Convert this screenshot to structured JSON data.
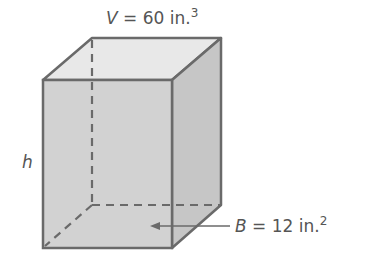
{
  "figure": {
    "type": "rectangular prism",
    "volume_label": {
      "var": "V",
      "eq": " = 60 in.",
      "sup": "3"
    },
    "height_label": "h",
    "base_label": {
      "var": "B",
      "eq": " = 12 in.",
      "sup": "2"
    }
  },
  "colors": {
    "front": "#d2d2d2",
    "top": "#e8e8e8",
    "side": "#c4c4c4",
    "edge": "#6a6a6a",
    "text": "#555555"
  }
}
